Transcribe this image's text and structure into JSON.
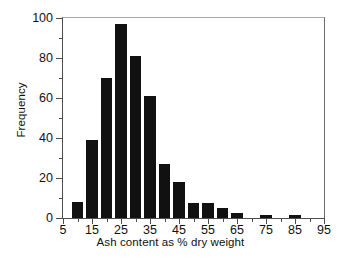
{
  "chart_data": {
    "type": "bar",
    "title": "",
    "subtitle": "",
    "xlabel": "Ash content as % dry weight",
    "ylabel": "Frequency",
    "xlim": [
      5,
      95
    ],
    "ylim": [
      0,
      100
    ],
    "grid": false,
    "legend": null,
    "bin_width": 5,
    "x_major_ticks": [
      5,
      15,
      25,
      35,
      45,
      55,
      65,
      75,
      85,
      95
    ],
    "x_major_tick_labels": [
      "5",
      "15",
      "25",
      "35",
      "45",
      "55",
      "65",
      "75",
      "85",
      "95"
    ],
    "x_minor_ticks": [
      10,
      20,
      30,
      40,
      50,
      60,
      70,
      80,
      90
    ],
    "y_major_ticks": [
      0,
      20,
      40,
      60,
      80,
      100
    ],
    "y_major_tick_labels": [
      "0",
      "20",
      "40",
      "60",
      "80",
      "100"
    ],
    "y_minor_ticks": [
      10,
      30,
      50,
      70,
      90
    ],
    "bar_color": "#111111",
    "categories": [
      10,
      15,
      20,
      25,
      30,
      35,
      40,
      45,
      50,
      55,
      60,
      65,
      70,
      75,
      80,
      85,
      90
    ],
    "values": [
      8,
      39,
      70,
      97,
      81,
      61,
      27,
      18,
      7.5,
      7.5,
      5,
      2.5,
      0,
      1.5,
      0,
      1.5,
      0
    ]
  },
  "bars": [
    {
      "center": 10,
      "value": 8
    },
    {
      "center": 15,
      "value": 39
    },
    {
      "center": 20,
      "value": 70
    },
    {
      "center": 25,
      "value": 97
    },
    {
      "center": 30,
      "value": 81
    },
    {
      "center": 35,
      "value": 61
    },
    {
      "center": 40,
      "value": 27
    },
    {
      "center": 45,
      "value": 18
    },
    {
      "center": 50,
      "value": 7.5
    },
    {
      "center": 55,
      "value": 7.5
    },
    {
      "center": 60,
      "value": 5
    },
    {
      "center": 65,
      "value": 2.5
    },
    {
      "center": 75,
      "value": 1.5
    },
    {
      "center": 85,
      "value": 1.5
    }
  ]
}
